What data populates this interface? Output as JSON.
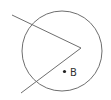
{
  "diagram": {
    "type": "geometry",
    "stroke_color": "#6e6e6e",
    "point_color": "#222222",
    "circle": {
      "cx": 62,
      "cy": 51,
      "r": 40
    },
    "angle": {
      "vertex": {
        "x": 81,
        "y": 48
      },
      "ray_upper_end": {
        "x": 12,
        "y": 15
      },
      "ray_lower_end": {
        "x": 21,
        "y": 93
      }
    },
    "points": [
      {
        "label": "B",
        "x": 64.5,
        "y": 71.5,
        "label_x": 70,
        "label_y": 76
      }
    ]
  }
}
